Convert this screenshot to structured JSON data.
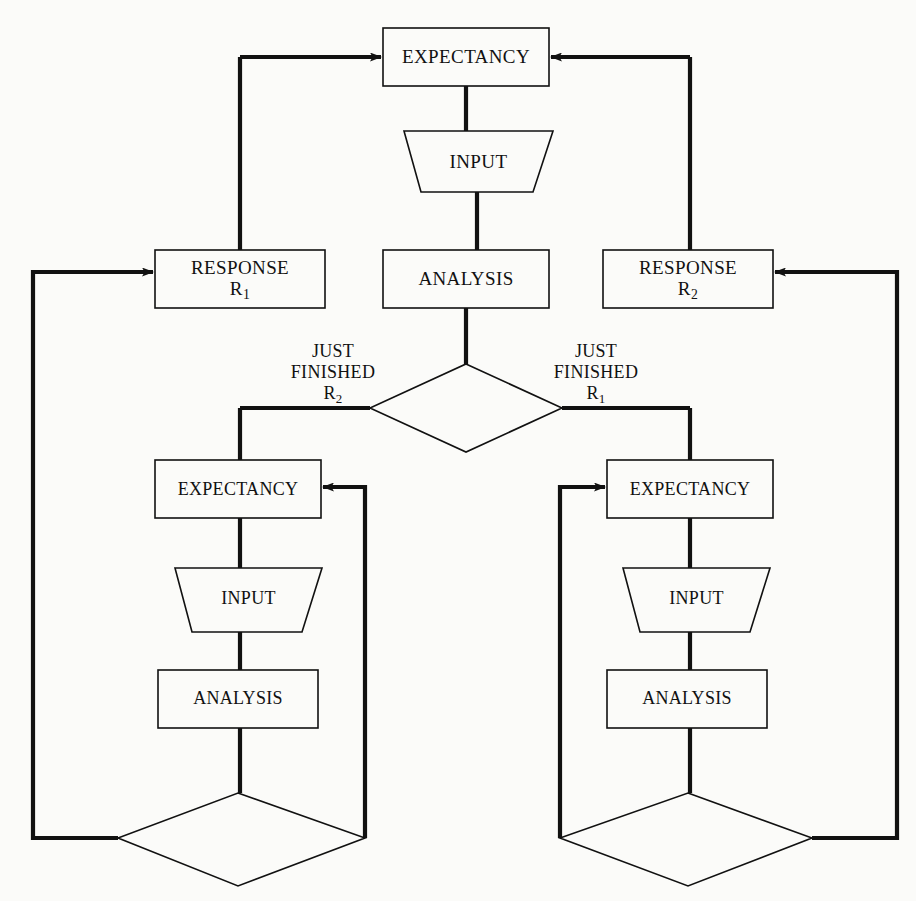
{
  "diagram": {
    "background_color": "#fbfbf9",
    "line_color": "#111111",
    "nodes": {
      "top_expectancy": {
        "label": "EXPECTANCY",
        "shape": "rectangle"
      },
      "top_input": {
        "label": "INPUT",
        "shape": "trapezoid"
      },
      "top_analysis": {
        "label": "ANALYSIS",
        "shape": "rectangle"
      },
      "response_r1": {
        "label_line1": "RESPONSE",
        "label_line2": "R",
        "label_sub2": "1",
        "shape": "rectangle"
      },
      "response_r2": {
        "label_line1": "RESPONSE",
        "label_line2": "R",
        "label_sub2": "2",
        "shape": "rectangle"
      },
      "center_decision": {
        "label": "",
        "shape": "diamond"
      },
      "left_expectancy": {
        "label": "EXPECTANCY",
        "shape": "rectangle"
      },
      "left_input": {
        "label": "INPUT",
        "shape": "trapezoid"
      },
      "left_analysis": {
        "label": "ANALYSIS",
        "shape": "rectangle"
      },
      "left_decision": {
        "label": "",
        "shape": "diamond"
      },
      "right_expectancy": {
        "label": "EXPECTANCY",
        "shape": "rectangle"
      },
      "right_input": {
        "label": "INPUT",
        "shape": "trapezoid"
      },
      "right_analysis": {
        "label": "ANALYSIS",
        "shape": "rectangle"
      },
      "right_decision": {
        "label": "",
        "shape": "diamond"
      }
    },
    "edge_labels": {
      "just_finished_r2": {
        "line1": "JUST",
        "line2": "FINISHED",
        "line3": "R",
        "sub3": "2"
      },
      "just_finished_r1": {
        "line1": "JUST",
        "line2": "FINISHED",
        "line3": "R",
        "sub3": "1"
      }
    }
  }
}
